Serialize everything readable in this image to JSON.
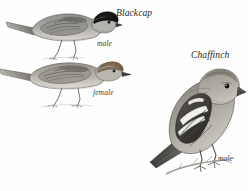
{
  "plate": {
    "background_color": "#fefefe",
    "ink_color": "#4a4a4a",
    "medium": "graphite-pencil-illustration"
  },
  "labels": {
    "blackcap_species": "Blackcap",
    "blackcap_male_sex": "male",
    "blackcap_female_sex": "female",
    "chaffinch_species": "Chaffinch",
    "chaffinch_male_sex": "male"
  },
  "figures": [
    {
      "id": "blackcap-male",
      "species": "Blackcap",
      "sex": "male",
      "pose": "perched-leaning-forward",
      "features": [
        "glossy black crown cap",
        "grey-brown upperparts",
        "pale grey underparts",
        "long slender tail",
        "thin pointed bill"
      ]
    },
    {
      "id": "blackcap-female",
      "species": "Blackcap",
      "sex": "female",
      "pose": "perched-horizontal",
      "features": [
        "warm brown crown cap",
        "olive-brown upperparts",
        "buff underparts",
        "long tail",
        "thin pointed bill"
      ]
    },
    {
      "id": "chaffinch-male",
      "species": "Chaffinch",
      "sex": "male",
      "pose": "perched-upright-on-branch",
      "features": [
        "bold white wing bars",
        "black and white wing panels",
        "stout conical bill",
        "rounded head",
        "notched tail"
      ]
    }
  ]
}
